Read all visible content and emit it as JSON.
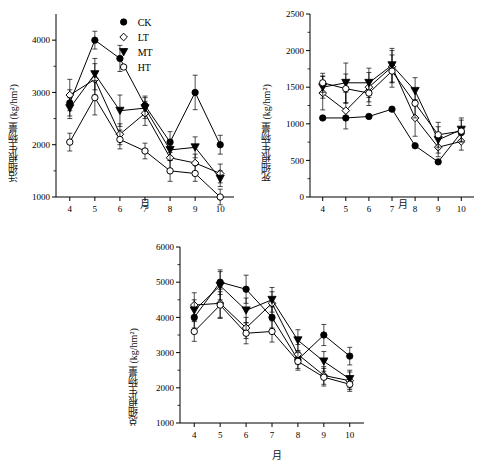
{
  "figure": {
    "background": "#ffffff",
    "line_color": "#000000"
  },
  "legend": {
    "entries": [
      {
        "label": "CK",
        "marker": "filled-circle"
      },
      {
        "label": "LT",
        "marker": "open-diamond"
      },
      {
        "label": "MT",
        "marker": "filled-triangle-down"
      },
      {
        "label": "HT",
        "marker": "open-circle"
      }
    ]
  },
  "chart_data": [
    {
      "type": "line",
      "id": "live-fine-root-biomass",
      "title": "",
      "xlabel": "月",
      "ylabel": "活细根生物量 (kg/hm²)",
      "x": [
        4,
        5,
        6,
        7,
        8,
        9,
        10
      ],
      "xticks": [
        "4",
        "5",
        "6",
        "7",
        "8",
        "9",
        "10"
      ],
      "ylim": [
        1000,
        4500
      ],
      "yticks": [
        1000,
        2000,
        3000,
        4000
      ],
      "grid": false,
      "legend_position": "top-center",
      "series": [
        {
          "name": "CK",
          "marker": "filled-circle",
          "values": [
            2800,
            4000,
            3650,
            2750,
            2050,
            3000,
            2000
          ],
          "err": [
            250,
            170,
            250,
            180,
            200,
            330,
            180
          ]
        },
        {
          "name": "LT",
          "marker": "open-diamond",
          "values": [
            2950,
            3250,
            2200,
            2600,
            1750,
            1650,
            1450
          ],
          "err": [
            300,
            300,
            200,
            230,
            230,
            170,
            180
          ]
        },
        {
          "name": "MT",
          "marker": "filled-triangle-down",
          "values": [
            2700,
            3350,
            2650,
            2700,
            1900,
            1950,
            1350
          ],
          "err": [
            200,
            300,
            300,
            200,
            200,
            200,
            150
          ]
        },
        {
          "name": "HT",
          "marker": "open-circle",
          "values": [
            2050,
            2900,
            2100,
            1880,
            1500,
            1450,
            1000
          ],
          "err": [
            170,
            330,
            180,
            150,
            200,
            150,
            150
          ]
        }
      ]
    },
    {
      "type": "line",
      "id": "dead-fine-root-biomass",
      "title": "",
      "xlabel": "月",
      "ylabel": "死细根生物量 (kg/hm²)",
      "x": [
        4,
        5,
        6,
        7,
        8,
        9,
        10
      ],
      "xticks": [
        "4",
        "5",
        "6",
        "7",
        "8",
        "9",
        "10"
      ],
      "ylim": [
        0,
        2500
      ],
      "yticks": [
        0,
        500,
        1000,
        1500,
        2000,
        2500
      ],
      "grid": false,
      "legend_position": "none",
      "series": [
        {
          "name": "CK",
          "marker": "filled-circle",
          "values": [
            1080,
            1080,
            1100,
            1200,
            700,
            480,
            880
          ],
          "err": [
            0,
            0,
            0,
            0,
            0,
            0,
            0
          ]
        },
        {
          "name": "LT",
          "marker": "open-diamond",
          "values": [
            1420,
            1180,
            1500,
            1780,
            1080,
            680,
            760
          ],
          "err": [
            230,
            250,
            200,
            220,
            250,
            130,
            120
          ]
        },
        {
          "name": "MT",
          "marker": "filled-triangle-down",
          "values": [
            1500,
            1560,
            1560,
            1800,
            1450,
            780,
            920
          ],
          "err": [
            150,
            270,
            200,
            230,
            180,
            180,
            160
          ]
        },
        {
          "name": "HT",
          "marker": "open-circle",
          "values": [
            1560,
            1480,
            1420,
            1720,
            1280,
            850,
            900
          ],
          "err": [
            130,
            200,
            170,
            220,
            200,
            170,
            150
          ]
        }
      ]
    },
    {
      "type": "line",
      "id": "total-fine-root-biomass",
      "title": "",
      "xlabel": "月",
      "ylabel": "总细根生物量 (kg/hm²)",
      "x": [
        4,
        5,
        6,
        7,
        8,
        9,
        10
      ],
      "xticks": [
        "4",
        "5",
        "6",
        "7",
        "8",
        "9",
        "10"
      ],
      "ylim": [
        1000,
        6000
      ],
      "yticks": [
        1000,
        2000,
        3000,
        4000,
        5000,
        6000
      ],
      "grid": false,
      "legend_position": "none",
      "series": [
        {
          "name": "CK",
          "marker": "filled-circle",
          "values": [
            4000,
            5000,
            4800,
            4000,
            2800,
            3500,
            2900
          ],
          "err": [
            300,
            350,
            400,
            300,
            250,
            300,
            250
          ]
        },
        {
          "name": "LT",
          "marker": "open-diamond",
          "values": [
            4350,
            4400,
            3700,
            4400,
            2950,
            2350,
            2200
          ],
          "err": [
            350,
            400,
            300,
            330,
            280,
            250,
            250
          ]
        },
        {
          "name": "MT",
          "marker": "filled-triangle-down",
          "values": [
            4200,
            4900,
            4200,
            4500,
            3350,
            2750,
            2250
          ],
          "err": [
            300,
            400,
            350,
            350,
            300,
            280,
            250
          ]
        },
        {
          "name": "HT",
          "marker": "open-circle",
          "values": [
            3600,
            4350,
            3550,
            3600,
            2750,
            2300,
            2100
          ],
          "err": [
            280,
            380,
            300,
            300,
            250,
            250,
            200
          ]
        }
      ]
    }
  ]
}
